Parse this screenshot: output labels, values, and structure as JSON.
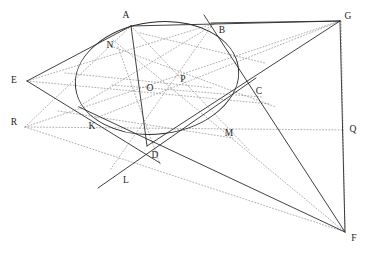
{
  "figure": {
    "kind": "geometry-diagram",
    "background_color": "#ffffff",
    "solid_stroke_color": "#2b2b2b",
    "dotted_stroke_color": "#9a9a9a",
    "label_color": "#1d1d1d",
    "width": 368,
    "height": 253
  },
  "conic": {
    "name": "ellipse",
    "center": {
      "x": 157,
      "y": 78
    },
    "radius_major": 82,
    "radius_minor": 56,
    "rotation_deg": -7
  },
  "points": [
    {
      "id": "A",
      "label": "A",
      "x": 131,
      "y": 26,
      "label_x": 126,
      "label_y": 16
    },
    {
      "id": "B",
      "label": "B",
      "x": 213,
      "y": 24,
      "label_x": 222,
      "label_y": 31
    },
    {
      "id": "C",
      "label": "C",
      "x": 248,
      "y": 88,
      "label_x": 259,
      "label_y": 92
    },
    {
      "id": "D",
      "label": "D",
      "x": 147,
      "y": 146,
      "label_x": 155,
      "label_y": 156
    },
    {
      "id": "E",
      "label": "E",
      "x": 27,
      "y": 81,
      "label_x": 14,
      "label_y": 81
    },
    {
      "id": "F",
      "label": "F",
      "x": 345,
      "y": 232,
      "label_x": 354,
      "label_y": 239
    },
    {
      "id": "G",
      "label": "G",
      "x": 340,
      "y": 21,
      "label_x": 348,
      "label_y": 17
    },
    {
      "id": "K",
      "label": "K",
      "x": 103,
      "y": 120,
      "label_x": 92,
      "label_y": 127
    },
    {
      "id": "L",
      "label": "L",
      "x": 112,
      "y": 175,
      "label_x": 126,
      "label_y": 181
    },
    {
      "id": "M",
      "label": "M",
      "x": 219,
      "y": 124,
      "label_x": 229,
      "label_y": 134
    },
    {
      "id": "N",
      "label": "N",
      "x": 120,
      "y": 52,
      "label_x": 110,
      "label_y": 46
    },
    {
      "id": "O",
      "label": "O",
      "x": 157,
      "y": 78,
      "label_x": 150,
      "label_y": 89
    },
    {
      "id": "P",
      "label": "P",
      "x": 189,
      "y": 80,
      "label_x": 183,
      "label_y": 80
    },
    {
      "id": "Q",
      "label": "Q",
      "x": 343,
      "y": 130,
      "label_x": 353,
      "label_y": 130
    },
    {
      "id": "R",
      "label": "R",
      "x": 25,
      "y": 127,
      "label_x": 14,
      "label_y": 123
    }
  ],
  "solid_segments": [
    {
      "name": "segment-E-A",
      "from": "E",
      "to": "A"
    },
    {
      "name": "segment-A-G",
      "from": "A",
      "to": "G"
    },
    {
      "name": "segment-A-B-extended",
      "from": "A",
      "to": "B"
    },
    {
      "name": "segment-B-G",
      "from": "B",
      "to": "G"
    },
    {
      "name": "segment-G-F",
      "from": "G",
      "to": "F"
    },
    {
      "name": "segment-B-F",
      "from": "B",
      "to": "F"
    },
    {
      "name": "segment-E-K-D",
      "from": "E",
      "to": "D"
    },
    {
      "name": "segment-K-F",
      "from": "K",
      "to": "F"
    },
    {
      "name": "segment-D-C-G",
      "from": "D",
      "to": "G"
    },
    {
      "name": "segment-A-D",
      "from": "A",
      "to": "D"
    },
    {
      "name": "segment-L-C",
      "from": "L",
      "to": "C"
    }
  ],
  "dotted_segments": [
    {
      "name": "dotted-E-B",
      "from": "E",
      "to": "B"
    },
    {
      "name": "dotted-E-C",
      "from": "E",
      "to": "C"
    },
    {
      "name": "dotted-R-A",
      "from": "R",
      "to": "A"
    },
    {
      "name": "dotted-R-G",
      "from": "R",
      "to": "G"
    },
    {
      "name": "dotted-R-F",
      "from": "R",
      "to": "F"
    },
    {
      "name": "dotted-R-Q",
      "from": "R",
      "to": "Q"
    },
    {
      "name": "dotted-G-Q",
      "from": "G",
      "to": "Q"
    },
    {
      "name": "dotted-Q-F",
      "from": "Q",
      "to": "F"
    },
    {
      "name": "dotted-N-M-F",
      "from": "N",
      "to": "F"
    },
    {
      "name": "dotted-N-C",
      "from": "N",
      "to": "C"
    },
    {
      "name": "dotted-K-B",
      "from": "K",
      "to": "B"
    },
    {
      "name": "dotted-K-G",
      "from": "K",
      "to": "G"
    },
    {
      "name": "dotted-A-M",
      "from": "A",
      "to": "M"
    },
    {
      "name": "dotted-N-D",
      "from": "N",
      "to": "D"
    },
    {
      "name": "dotted-B-L",
      "from": "B",
      "to": "L"
    },
    {
      "name": "dotted-E-P",
      "from": "E",
      "to": "P"
    },
    {
      "name": "dotted-O-P-C",
      "from": "O",
      "to": "C"
    }
  ]
}
